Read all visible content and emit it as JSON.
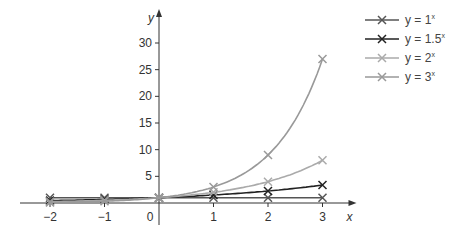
{
  "chart_data": {
    "type": "line",
    "title": "",
    "xlabel": "x",
    "ylabel": "y",
    "xlim": [
      -2,
      3
    ],
    "ylim": [
      0,
      30
    ],
    "x_ticks": [
      -2,
      -1,
      0,
      1,
      2,
      3
    ],
    "y_ticks": [
      5,
      10,
      15,
      20,
      25,
      30
    ],
    "x": [
      -2,
      -1,
      0,
      1,
      2,
      3
    ],
    "series": [
      {
        "name": "y = 1^x",
        "base": "1",
        "color": "#555555",
        "values": [
          1,
          1,
          1,
          1,
          1,
          1
        ]
      },
      {
        "name": "y = 1.5^x",
        "base": "1.5",
        "color": "#222222",
        "values": [
          0.44,
          0.67,
          1,
          1.5,
          2.25,
          3.375
        ]
      },
      {
        "name": "y = 2^x",
        "base": "2",
        "color": "#aaaaaa",
        "values": [
          0.25,
          0.5,
          1,
          2,
          4,
          8
        ]
      },
      {
        "name": "y = 3^x",
        "base": "3",
        "color": "#999999",
        "values": [
          0.11,
          0.33,
          1,
          3,
          9,
          27
        ]
      }
    ],
    "grid": false,
    "legend_position": "top-right",
    "marker": "x"
  },
  "legend": {
    "items": [
      {
        "prefix": "y = ",
        "base": "1",
        "exp": "x"
      },
      {
        "prefix": "y = ",
        "base": "1.5",
        "exp": "x"
      },
      {
        "prefix": "y = ",
        "base": "2",
        "exp": "x"
      },
      {
        "prefix": "y = ",
        "base": "3",
        "exp": "x"
      }
    ]
  }
}
